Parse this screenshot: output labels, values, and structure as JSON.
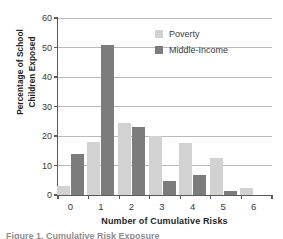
{
  "chart_data": {
    "type": "bar",
    "title": "",
    "xlabel": "Number of Cumulative Risks",
    "ylabel": "Percentage of School Children Exposed",
    "ylabel_lines": [
      "Percentage of School",
      "Children Exposed"
    ],
    "categories": [
      "0",
      "1",
      "2",
      "3",
      "4",
      "5",
      "6"
    ],
    "yticks": [
      0,
      10,
      20,
      30,
      40,
      50,
      60
    ],
    "ylim": [
      0,
      60
    ],
    "grid": true,
    "legend_position": "top-right",
    "series": [
      {
        "name": "Poverty",
        "color": "#d2d2d2",
        "values": [
          3,
          18,
          24.5,
          20,
          17.5,
          12.5,
          2.5
        ]
      },
      {
        "name": "Middle-Income",
        "color": "#7c7c7c",
        "values": [
          14,
          51,
          23,
          4.8,
          6.7,
          1.5,
          0
        ]
      }
    ]
  },
  "caption": {
    "text": "Figure 1. Cumulative Risk Exposure"
  }
}
